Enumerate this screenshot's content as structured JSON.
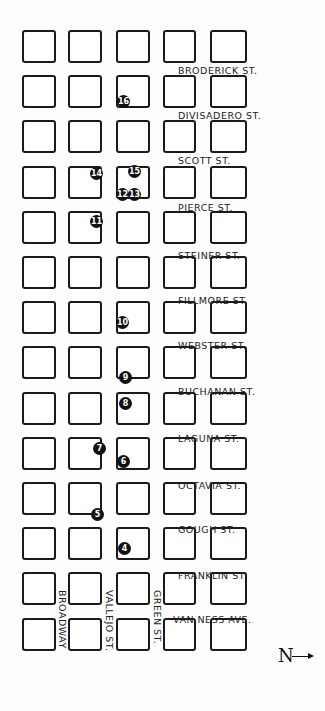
{
  "map": {
    "grid": {
      "columns": 5,
      "rows": 14
    },
    "horizontal_streets": [
      {
        "name": "Broderick St.",
        "y": 65
      },
      {
        "name": "Divisadero St.",
        "y": 110
      },
      {
        "name": "Scott St.",
        "y": 155
      },
      {
        "name": "Pierce St.",
        "y": 202
      },
      {
        "name": "Steiner St.",
        "y": 250
      },
      {
        "name": "Fillmore St.",
        "y": 295
      },
      {
        "name": "Webster St.",
        "y": 340
      },
      {
        "name": "Buchanan St.",
        "y": 386
      },
      {
        "name": "Laguna St.",
        "y": 433
      },
      {
        "name": "Octavia St.",
        "y": 480
      },
      {
        "name": "Gough St.",
        "y": 524
      },
      {
        "name": "Franklin St.",
        "y": 570
      },
      {
        "name": "Van Ness Ave.",
        "y": 614
      }
    ],
    "vertical_streets": [
      {
        "name": "Broadway",
        "x": 57
      },
      {
        "name": "Vallejo St.",
        "x": 104
      },
      {
        "name": "Green St.",
        "x": 152
      }
    ],
    "markers": [
      {
        "n": "4",
        "x": 118,
        "y": 542
      },
      {
        "n": "5",
        "x": 91,
        "y": 508
      },
      {
        "n": "6",
        "x": 117,
        "y": 455
      },
      {
        "n": "7",
        "x": 93,
        "y": 442
      },
      {
        "n": "8",
        "x": 119,
        "y": 397
      },
      {
        "n": "9",
        "x": 119,
        "y": 371
      },
      {
        "n": "10",
        "x": 116,
        "y": 316
      },
      {
        "n": "11",
        "x": 90,
        "y": 215
      },
      {
        "n": "12",
        "x": 116,
        "y": 188
      },
      {
        "n": "13",
        "x": 128,
        "y": 188
      },
      {
        "n": "14",
        "x": 90,
        "y": 167
      },
      {
        "n": "15",
        "x": 128,
        "y": 165
      },
      {
        "n": "16",
        "x": 117,
        "y": 95
      }
    ],
    "compass": {
      "label": "N",
      "direction": "right"
    }
  }
}
